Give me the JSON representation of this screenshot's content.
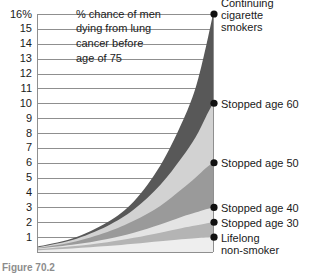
{
  "figure": {
    "caption": "Figure 70.2",
    "annotation_lines": [
      "% chance of men",
      "dying from lung",
      "cancer before",
      "age of 75"
    ]
  },
  "chart_data": {
    "type": "area",
    "xlabel": "",
    "ylabel": "% chance of men dying from lung cancer before age of 75",
    "ylim": [
      0,
      16
    ],
    "xlim": [
      0,
      100
    ],
    "grid": true,
    "legend_position": "right-axis-markers",
    "ytick_labels": [
      "16%",
      "15",
      "14",
      "13",
      "12",
      "11",
      "10",
      "9",
      "8",
      "7",
      "6",
      "5",
      "4",
      "3",
      "2",
      "1"
    ],
    "ytick_values": [
      16,
      15,
      14,
      13,
      12,
      11,
      10,
      9,
      8,
      7,
      6,
      5,
      4,
      3,
      2,
      1
    ],
    "series": [
      {
        "name": "Continuing cigarette smokers",
        "end_value": 16,
        "fill": "#585858",
        "x": [
          0,
          20,
          40,
          55,
          70,
          82,
          90,
          96,
          100
        ],
        "values": [
          0.35,
          0.9,
          2.0,
          3.4,
          5.8,
          8.6,
          11.0,
          13.8,
          16.0
        ]
      },
      {
        "name": "Stopped age 60",
        "end_value": 10,
        "fill": "#d2d2d2",
        "x": [
          0,
          20,
          40,
          55,
          70,
          82,
          90,
          96,
          100
        ],
        "values": [
          0.3,
          0.8,
          1.75,
          2.85,
          4.5,
          6.3,
          7.7,
          9.1,
          10.0
        ]
      },
      {
        "name": "Stopped age 50",
        "end_value": 6,
        "fill": "#9a9a9a",
        "x": [
          0,
          20,
          40,
          55,
          70,
          82,
          90,
          96,
          100
        ],
        "values": [
          0.26,
          0.66,
          1.35,
          2.1,
          3.1,
          4.2,
          5.0,
          5.65,
          6.0
        ]
      },
      {
        "name": "Stopped age 40",
        "end_value": 3,
        "fill": "#e4e4e4",
        "x": [
          0,
          20,
          40,
          55,
          70,
          82,
          90,
          96,
          100
        ],
        "values": [
          0.22,
          0.48,
          0.88,
          1.3,
          1.85,
          2.35,
          2.65,
          2.88,
          3.0
        ]
      },
      {
        "name": "Stopped age 30",
        "end_value": 2,
        "fill": "#b4b4b4",
        "x": [
          0,
          20,
          40,
          55,
          70,
          82,
          90,
          96,
          100
        ],
        "values": [
          0.18,
          0.38,
          0.66,
          0.95,
          1.3,
          1.6,
          1.78,
          1.92,
          2.0
        ]
      },
      {
        "name": "Lifelong non-smoker",
        "end_value": 1,
        "fill": "#eeeeee",
        "x": [
          0,
          20,
          40,
          55,
          70,
          82,
          90,
          96,
          100
        ],
        "values": [
          0.12,
          0.24,
          0.4,
          0.55,
          0.72,
          0.86,
          0.93,
          0.98,
          1.0
        ]
      }
    ],
    "markers": [
      {
        "label_lines": [
          "Continuing",
          "cigarette",
          "smokers"
        ],
        "value": 16
      },
      {
        "label_lines": [
          "Stopped age 60"
        ],
        "value": 10
      },
      {
        "label_lines": [
          "Stopped age 50"
        ],
        "value": 6
      },
      {
        "label_lines": [
          "Stopped age 40"
        ],
        "value": 3
      },
      {
        "label_lines": [
          "Stopped age 30"
        ],
        "value": 2
      },
      {
        "label_lines": [
          "Lifelong",
          "non-smoker"
        ],
        "value": 1
      }
    ],
    "colors": {
      "gridline": "#8f8f8f",
      "axis": "#8f8f8f",
      "marker": "#111111",
      "text": "#1a1a1a"
    }
  }
}
